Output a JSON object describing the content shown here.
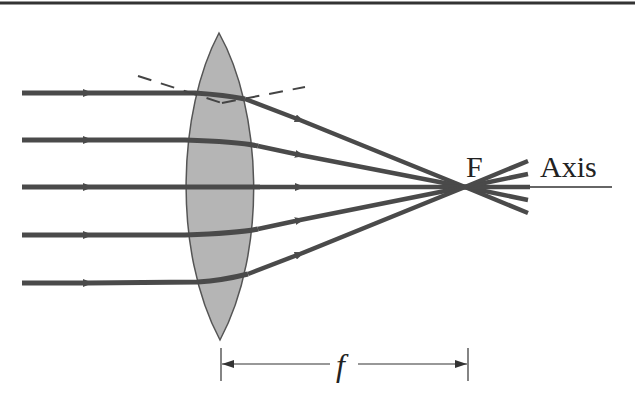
{
  "diagram": {
    "labels": {
      "focal_point": "F",
      "axis": "Axis",
      "focal_length": "f"
    },
    "colors": {
      "background": "#ffffff",
      "lens_fill": "#b5b5b5",
      "lens_stroke": "#555555",
      "ray": "#4a4a4a",
      "axis_line": "#333333",
      "border": "#333333"
    },
    "rays": [
      {
        "y": 93,
        "label": "ray-1"
      },
      {
        "y": 140,
        "label": "ray-2"
      },
      {
        "y": 187,
        "label": "ray-3-axis"
      },
      {
        "y": 235,
        "label": "ray-4"
      },
      {
        "y": 283,
        "label": "ray-5"
      }
    ],
    "components": [
      "incident parallel rays",
      "convex lens",
      "normal line (dashed)",
      "focal point F",
      "principal axis",
      "focal length dimension f"
    ]
  }
}
